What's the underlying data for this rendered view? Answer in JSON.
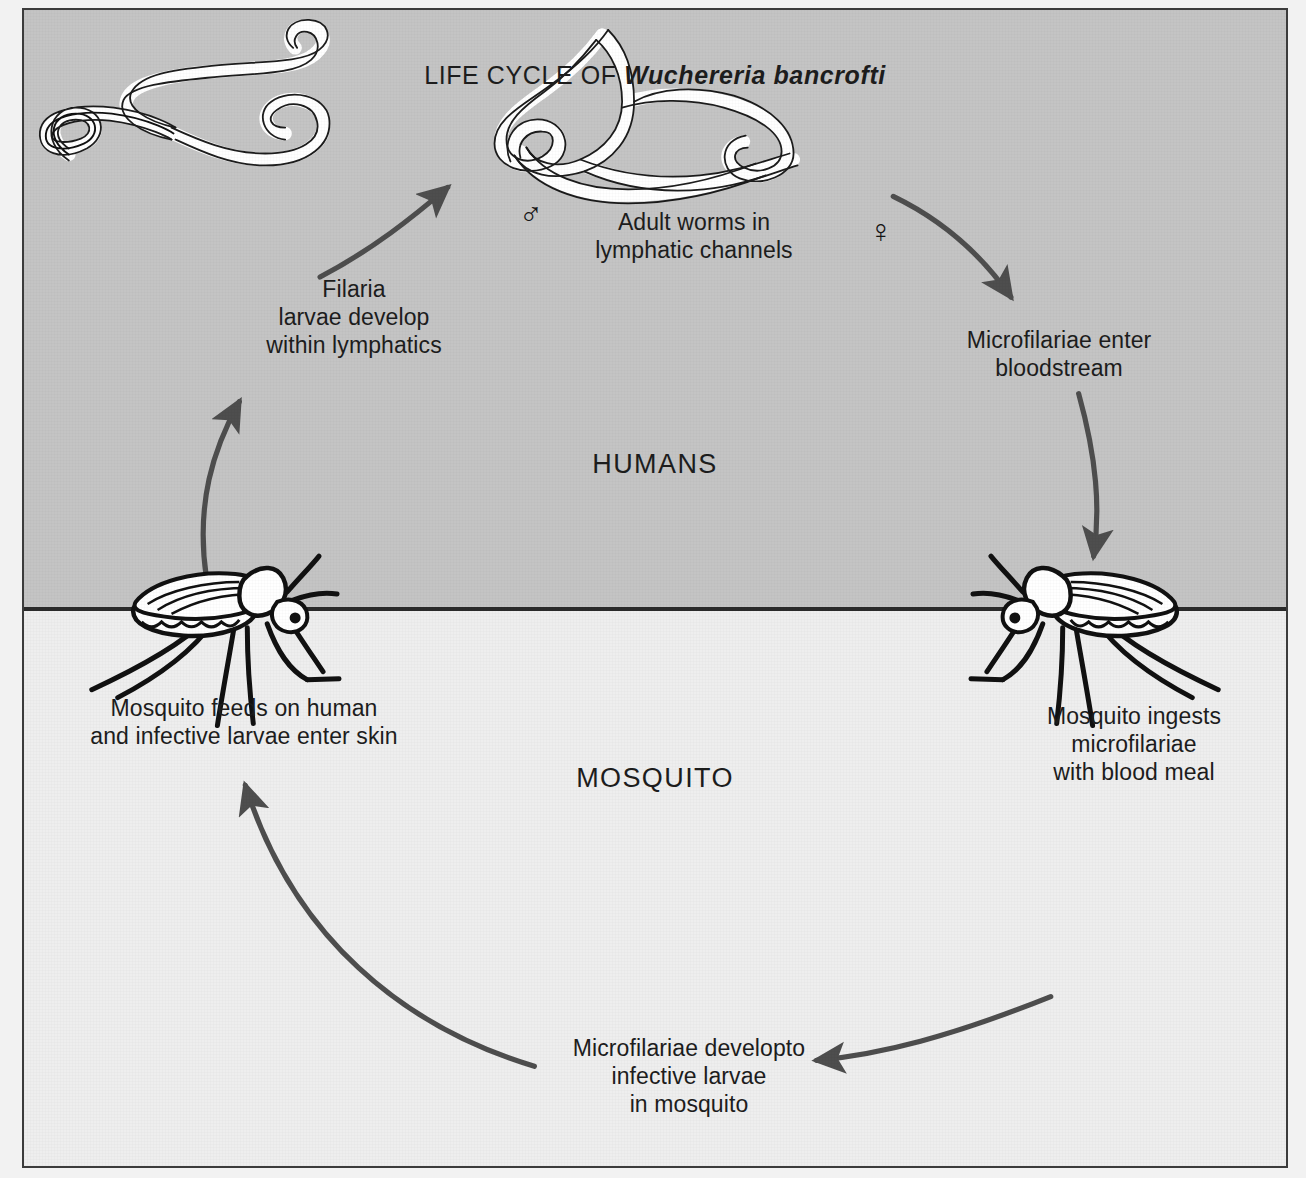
{
  "figure": {
    "title_prefix": "LIFE CYCLE OF ",
    "title_species": "Wuchereria bancrofti",
    "title_full": "LIFE CYCLE OF Wuchereria bancrofti",
    "host_region_label": "HUMANS",
    "vector_region_label": "MOSQUITO",
    "colors": {
      "human_band": "#c4c4c4",
      "mosquito_band": "#eeeeee",
      "arrow": "#4e4e4e",
      "ink": "#1d1d1d",
      "border": "#3c3c3c",
      "divider": "#2b2b2b",
      "worm_fill": "#ffffff",
      "worm_outline": "#111111"
    }
  },
  "stages": [
    {
      "id": "adult-worms",
      "text": "Adult worms in\nlymphatic channels",
      "region": "humans"
    },
    {
      "id": "microfilariae-bloodstream",
      "text": "Microfilariae enter\nbloodstream",
      "region": "humans"
    },
    {
      "id": "mosquito-ingests",
      "text": "Mosquito ingests\nmicrofilariae\nwith blood meal",
      "region": "mosquito"
    },
    {
      "id": "larvae-develop-mosquito",
      "text": "Microfilariae developto\ninfective larvae\nin mosquito",
      "region": "mosquito"
    },
    {
      "id": "mosquito-feeds",
      "text": "Mosquito feeds on human\nand infective larvae enter skin",
      "region": "mosquito"
    },
    {
      "id": "filaria-larvae-lymphatics",
      "text": "Filaria\nlarvae develop\nwithin lymphatics",
      "region": "humans"
    }
  ],
  "symbols": {
    "male": "♂",
    "female": "♀"
  },
  "illustrations": {
    "worm_male": "male-adult-worm",
    "worm_female": "female-adult-worm",
    "mosquito_left": "mosquito-feeding-left",
    "mosquito_right": "mosquito-feeding-right"
  }
}
